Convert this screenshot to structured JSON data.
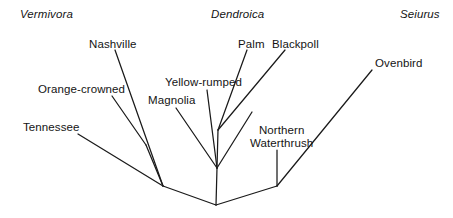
{
  "figure": {
    "kind": "phylogenetic-tree",
    "background_color": "#ffffff",
    "line_color": "#1a1a1a",
    "text_color": "#141414"
  },
  "genera": [
    {
      "name": "Vermivora",
      "x": 20,
      "y": 8
    },
    {
      "name": "Dendroica",
      "x": 211,
      "y": 8
    },
    {
      "name": "Seiurus",
      "x": 400,
      "y": 8
    }
  ],
  "species": [
    {
      "name": "Nashville",
      "x": 89,
      "y": 38
    },
    {
      "name": "Palm",
      "x": 238,
      "y": 38
    },
    {
      "name": "Blackpoll",
      "x": 272,
      "y": 38
    },
    {
      "name": "Ovenbird",
      "x": 375,
      "y": 57
    },
    {
      "name": "Yellow-rumped",
      "x": 165,
      "y": 76
    },
    {
      "name": "Orange-crowned",
      "x": 38,
      "y": 83
    },
    {
      "name": "Magnolia",
      "x": 148,
      "y": 94
    },
    {
      "name": "Tennessee",
      "x": 23,
      "y": 121
    },
    {
      "name": "Northern Waterthrush",
      "line1": "Northern",
      "line2": "Waterthrush",
      "x": 250,
      "y": 124
    }
  ],
  "nodes": {
    "root": {
      "x": 216,
      "y": 205
    },
    "vermivora_node": {
      "x": 163,
      "y": 186
    },
    "seiurus_node": {
      "x": 277,
      "y": 186
    },
    "dendroica_node": {
      "x": 217,
      "y": 168
    },
    "palm_blackpoll_node": {
      "x": 218,
      "y": 130
    }
  },
  "branches": [
    {
      "name": "root-to-vermivora",
      "x1": 216,
      "y1": 205,
      "x2": 163,
      "y2": 186
    },
    {
      "name": "root-to-dendroica",
      "x1": 216,
      "y1": 205,
      "x2": 217,
      "y2": 168
    },
    {
      "name": "root-to-seiurus",
      "x1": 216,
      "y1": 205,
      "x2": 277,
      "y2": 186
    },
    {
      "name": "vermivora-to-tennessee",
      "x1": 163,
      "y1": 186,
      "x2": 78,
      "y2": 134
    },
    {
      "name": "vermivora-to-orange-crowned",
      "x1": 163,
      "y1": 186,
      "x2": 146,
      "y2": 145
    },
    {
      "name": "orange-crowned-tip",
      "x1": 146,
      "y1": 145,
      "x2": 112,
      "y2": 96
    },
    {
      "name": "vermivora-to-nashville",
      "x1": 163,
      "y1": 186,
      "x2": 115,
      "y2": 50
    },
    {
      "name": "dendroica-to-magnolia",
      "x1": 217,
      "y1": 168,
      "x2": 176,
      "y2": 108
    },
    {
      "name": "dendroica-to-yellow-rumped",
      "x1": 217,
      "y1": 168,
      "x2": 207,
      "y2": 90
    },
    {
      "name": "dendroica-to-palm-blackpoll",
      "x1": 217,
      "y1": 168,
      "x2": 218,
      "y2": 130
    },
    {
      "name": "dendroica-to-northern-waterthrush-side",
      "x1": 217,
      "y1": 168,
      "x2": 252,
      "y2": 112
    },
    {
      "name": "palm-blackpoll-to-palm",
      "x1": 218,
      "y1": 130,
      "x2": 247,
      "y2": 50
    },
    {
      "name": "palm-blackpoll-to-blackpoll",
      "x1": 218,
      "y1": 130,
      "x2": 285,
      "y2": 50
    },
    {
      "name": "seiurus-to-waterthrush",
      "x1": 277,
      "y1": 186,
      "x2": 277,
      "y2": 150
    },
    {
      "name": "seiurus-to-ovenbird",
      "x1": 277,
      "y1": 186,
      "x2": 372,
      "y2": 70
    }
  ]
}
